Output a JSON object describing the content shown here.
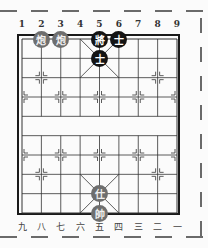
{
  "board": {
    "type": "xiangqi",
    "top_labels": [
      "1",
      "2",
      "3",
      "4",
      "5",
      "6",
      "7",
      "8",
      "9"
    ],
    "bottom_labels": [
      "九",
      "八",
      "七",
      "六",
      "五",
      "四",
      "三",
      "二",
      "一"
    ],
    "river_text": "",
    "colors": {
      "black_piece": "#141414",
      "red_piece": "#6e6e6e",
      "grid": "#333333"
    }
  },
  "pieces": [
    {
      "side": "red",
      "name": "炮",
      "file": 2,
      "rank": 0,
      "label": "炮"
    },
    {
      "side": "red",
      "name": "炮",
      "file": 3,
      "rank": 0,
      "label": "炮"
    },
    {
      "side": "black",
      "name": "將",
      "file": 5,
      "rank": 0,
      "label": "將"
    },
    {
      "side": "black",
      "name": "士",
      "file": 6,
      "rank": 0,
      "label": "士"
    },
    {
      "side": "black",
      "name": "士",
      "file": 5,
      "rank": 1,
      "label": "士"
    },
    {
      "side": "red",
      "name": "仕",
      "file": 5,
      "rank": 8,
      "label": "仕"
    },
    {
      "side": "red",
      "name": "帥",
      "file": 5,
      "rank": 9,
      "label": "帥"
    }
  ]
}
